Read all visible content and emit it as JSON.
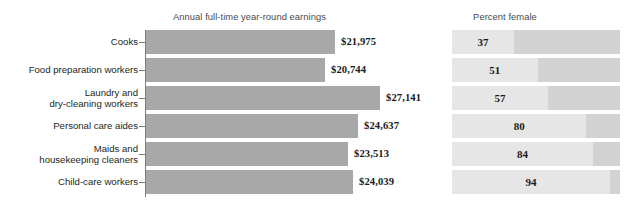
{
  "chart_data": {
    "type": "bar",
    "title": "",
    "panels": [
      {
        "name": "earnings",
        "title": "Annual full-time year-round earnings",
        "xlabel": "",
        "ylabel": "",
        "grid": false,
        "axis_visible": true,
        "xlim": [
          0,
          29500
        ]
      },
      {
        "name": "percent_female",
        "title": "Percent female",
        "xlabel": "",
        "ylabel": "",
        "grid": false,
        "axis_visible": false,
        "xlim": [
          0,
          100
        ]
      }
    ],
    "categories": [
      "Cooks",
      "Food preparation workers",
      "Laundry and dry-cleaning workers",
      "Personal care aides",
      "Maids and housekeeping cleaners",
      "Child-care workers"
    ],
    "series": [
      {
        "name": "Annual full-time year-round earnings",
        "unit": "USD",
        "values": [
          21975,
          20744,
          27141,
          24637,
          23513,
          24039
        ],
        "labels": [
          "$21,975",
          "$20,744",
          "$27,141",
          "$24,637",
          "$23,513",
          "$24,039"
        ]
      },
      {
        "name": "Percent female",
        "unit": "percent",
        "values": [
          37,
          51,
          57,
          80,
          84,
          94
        ],
        "labels": [
          "37",
          "51",
          "57",
          "80",
          "84",
          "94"
        ]
      }
    ],
    "legend": [],
    "legend_position": "none",
    "colors": {
      "earnings_bar": "#a8a8a8",
      "percent_track": "#d2d2d2",
      "percent_fill": "#e6e6e6",
      "axis": "#7d7d7d",
      "label_text": "#231f20",
      "title_text": "#4a4a4a",
      "value_text": "#1b1b1b",
      "background": "#ffffff"
    }
  },
  "rows": [
    {
      "category_line1": "Cooks",
      "category_line2": "",
      "earnings_label": "$21,975",
      "percent_label": "37"
    },
    {
      "category_line1": "Food preparation workers",
      "category_line2": "",
      "earnings_label": "$20,744",
      "percent_label": "51"
    },
    {
      "category_line1": "Laundry and",
      "category_line2": "dry-cleaning workers",
      "earnings_label": "$27,141",
      "percent_label": "57"
    },
    {
      "category_line1": "Personal care aides",
      "category_line2": "",
      "earnings_label": "$24,637",
      "percent_label": "80"
    },
    {
      "category_line1": "Maids and",
      "category_line2": "housekeeping cleaners",
      "earnings_label": "$23,513",
      "percent_label": "84"
    },
    {
      "category_line1": "Child-care workers",
      "category_line2": "",
      "earnings_label": "$24,039",
      "percent_label": "94"
    }
  ],
  "headers": {
    "earnings_title": "Annual full-time year-round earnings",
    "percent_title": "Percent female"
  }
}
